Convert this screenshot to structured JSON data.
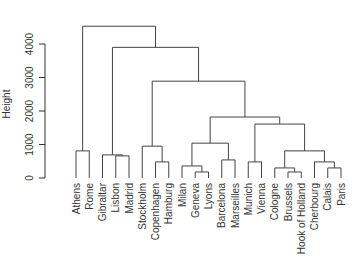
{
  "chart_data": {
    "type": "dendrogram",
    "title": "",
    "xlabel": "",
    "ylabel": "Height",
    "ylim": [
      0,
      4600
    ],
    "yticks": [
      0,
      1000,
      2000,
      3000,
      4000
    ],
    "leaves": [
      "Athens",
      "Rome",
      "Gibraltar",
      "Lisbon",
      "Madrid",
      "Stockholm",
      "Copenhagen",
      "Hamburg",
      "Milan",
      "Geneva",
      "Lyons",
      "Barcelona",
      "Marseilles",
      "Munich",
      "Vienna",
      "Cologne",
      "Brussels",
      "Hook of Holland",
      "Cherbourg",
      "Calais",
      "Paris"
    ],
    "merges": [
      {
        "left": "Athens",
        "right": "Rome",
        "height": 810
      },
      {
        "left": "Lisbon",
        "right": "Madrid",
        "height": 660
      },
      {
        "left": "Gibraltar",
        "right": "(Lisbon,Madrid)",
        "height": 690
      },
      {
        "left": "Copenhagen",
        "right": "Hamburg",
        "height": 480
      },
      {
        "left": "Stockholm",
        "right": "(Copenhagen,Hamburg)",
        "height": 950
      },
      {
        "left": "Geneva",
        "right": "Lyons",
        "height": 180
      },
      {
        "left": "Milan",
        "right": "(Geneva,Lyons)",
        "height": 360
      },
      {
        "left": "Barcelona",
        "right": "Marseilles",
        "height": 540
      },
      {
        "left": "(Milan,Geneva,Lyons)",
        "right": "(Barcelona,Marseilles)",
        "height": 1040
      },
      {
        "left": "Munich",
        "right": "Vienna",
        "height": 480
      },
      {
        "left": "Brussels",
        "right": "Hook of Holland",
        "height": 180
      },
      {
        "left": "Cologne",
        "right": "(Brussels,Hook of Holland)",
        "height": 300
      },
      {
        "left": "Calais",
        "right": "Paris",
        "height": 300
      },
      {
        "left": "Cherbourg",
        "right": "(Calais,Paris)",
        "height": 480
      },
      {
        "left": "(Cologne,Brussels,Hook of Holland)",
        "right": "(Cherbourg,Calais,Paris)",
        "height": 810
      },
      {
        "left": "(Munich,Vienna)",
        "right": "(Cologne..Paris)",
        "height": 1610
      },
      {
        "left": "(Milan..Marseilles)",
        "right": "(Munich..Paris)",
        "height": 1820
      },
      {
        "left": "(Stockholm,Copenhagen,Hamburg)",
        "right": "(Milan..Paris)",
        "height": 2890
      },
      {
        "left": "(Gibraltar,Lisbon,Madrid)",
        "right": "(Stockholm..Paris)",
        "height": 3900
      },
      {
        "left": "(Athens,Rome)",
        "right": "(Gibraltar..Paris)",
        "height": 4530
      }
    ]
  }
}
